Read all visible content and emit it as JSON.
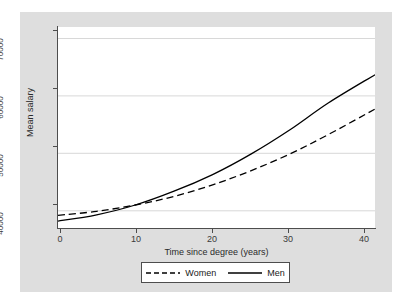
{
  "chart_data": {
    "type": "line",
    "title": "",
    "xlabel": "Time since degree (years)",
    "ylabel": "Mean salary",
    "xlim": [
      0,
      41
    ],
    "ylim": [
      37000,
      72000
    ],
    "xticks": [
      0,
      10,
      20,
      30,
      40
    ],
    "xtick_labels": [
      "0",
      "10",
      "20",
      "30",
      "40"
    ],
    "yticks": [
      40000,
      50000,
      60000,
      70000
    ],
    "ytick_labels": [
      "40000",
      "50000",
      "60000",
      "70000"
    ],
    "grid": "horizontal",
    "legend_position": "bottom",
    "x": [
      0,
      5,
      10,
      15,
      20,
      25,
      30,
      35,
      41
    ],
    "series": [
      {
        "name": "Women",
        "style": "dashed",
        "color": "#000000",
        "values": [
          39200,
          39900,
          41000,
          42500,
          44500,
          47000,
          49900,
          53300,
          57700
        ]
      },
      {
        "name": "Men",
        "style": "solid",
        "color": "#000000",
        "values": [
          38200,
          39300,
          41000,
          43400,
          46300,
          49900,
          54100,
          58800,
          63700
        ]
      }
    ],
    "annotations": []
  },
  "axes": {
    "x_title": "Time since degree (years)",
    "y_title": "Mean salary",
    "x_tick_labels": [
      "0",
      "10",
      "20",
      "30",
      "40"
    ],
    "y_tick_labels": [
      "40000",
      "50000",
      "60000",
      "70000"
    ]
  },
  "legend": {
    "items": [
      {
        "label": "Women",
        "style": "dashed"
      },
      {
        "label": "Men",
        "style": "solid"
      }
    ]
  },
  "colors": {
    "figure_background": "#dedede",
    "plot_background": "#ffffff",
    "axis": "#4d4d4d",
    "gridline": "#d8d8d8",
    "line": "#000000"
  }
}
